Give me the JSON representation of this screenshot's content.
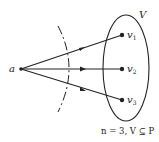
{
  "diagram": {
    "source_label": "a",
    "set_label": "V",
    "nodes": [
      {
        "id": "v1",
        "label": "v",
        "subscript": "1"
      },
      {
        "id": "v2",
        "label": "v",
        "subscript": "2"
      },
      {
        "id": "v3",
        "label": "v",
        "subscript": "3"
      }
    ],
    "caption": "n = 3, V ⊆ P",
    "colors": {
      "stroke": "#222222",
      "background": "#ffffff"
    }
  }
}
